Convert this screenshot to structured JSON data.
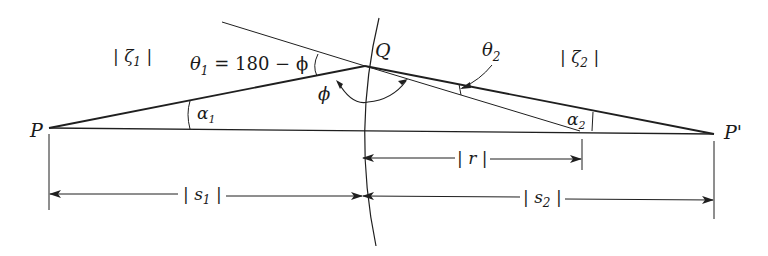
{
  "diagram": {
    "colors": {
      "line": "#1f1f1f",
      "text": "#1a1a1a",
      "background": "#ffffff"
    },
    "points": {
      "P": {
        "label": "P",
        "x": 49,
        "y": 128
      },
      "P_prime": {
        "label": "P'",
        "x": 714,
        "y": 134
      },
      "Q": {
        "label": "Q",
        "x": 365,
        "y": 66
      }
    },
    "media": {
      "left": {
        "prefix": "| ζ",
        "sub": "1",
        "suffix": " |"
      },
      "right": {
        "prefix": "| ζ",
        "sub": "2",
        "suffix": " |"
      }
    },
    "angles": {
      "theta1": {
        "sym": "θ",
        "sub": "1",
        "expr": " = 180 − ϕ"
      },
      "theta2": {
        "sym": "θ",
        "sub": "2"
      },
      "phi": {
        "sym": "ϕ"
      },
      "alpha1": {
        "sym": "α",
        "sub": "1"
      },
      "alpha2": {
        "sym": "α",
        "sub": "2"
      }
    },
    "dimensions": {
      "r": {
        "label": "| r |"
      },
      "s1": {
        "prefix": "| s",
        "sub": "1",
        "suffix": " |"
      },
      "s2": {
        "prefix": "| s",
        "sub": "2",
        "suffix": " |"
      }
    }
  }
}
